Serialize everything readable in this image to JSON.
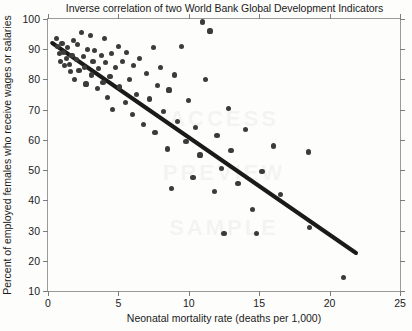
{
  "chart_data": {
    "type": "scatter",
    "title": "Inverse correlation of two World Bank Global Development Indicators",
    "xlabel": "Neonatal mortality rate (deaths per 1,000)",
    "ylabel": "Percent of employed females who receive wages or salaries",
    "xlim": [
      0,
      25
    ],
    "ylim": [
      10,
      100
    ],
    "xticks": [
      0,
      5,
      10,
      15,
      20,
      25
    ],
    "xtick_labels": [
      "0",
      "5",
      "10",
      "15",
      "20",
      "25"
    ],
    "yticks": [
      10,
      20,
      30,
      40,
      50,
      60,
      70,
      80,
      90,
      100
    ],
    "ytick_labels": [
      "10",
      "20",
      "30",
      "40",
      "50",
      "60",
      "70",
      "80",
      "90",
      "100"
    ],
    "grid": false,
    "legend": null,
    "marker_color": "#3b3b3b",
    "trendline_color": "#1a1a1a",
    "frame_color": "#9a9a9a",
    "background": "#fdfdfb",
    "trendline": {
      "label": "linear fit",
      "x0": 0.3,
      "y0": 92.0,
      "x1": 22.0,
      "y1": 22.0
    },
    "points": [
      {
        "x": 0.6,
        "y": 93.5
      },
      {
        "x": 0.7,
        "y": 91.0
      },
      {
        "x": 0.8,
        "y": 88.5
      },
      {
        "x": 0.9,
        "y": 86.0
      },
      {
        "x": 1.0,
        "y": 92.0
      },
      {
        "x": 1.1,
        "y": 89.0
      },
      {
        "x": 1.2,
        "y": 84.5
      },
      {
        "x": 1.3,
        "y": 87.0
      },
      {
        "x": 1.4,
        "y": 90.5
      },
      {
        "x": 1.5,
        "y": 85.0
      },
      {
        "x": 1.6,
        "y": 82.5
      },
      {
        "x": 1.7,
        "y": 88.0
      },
      {
        "x": 1.8,
        "y": 93.0
      },
      {
        "x": 1.9,
        "y": 80.0
      },
      {
        "x": 2.0,
        "y": 86.5
      },
      {
        "x": 2.1,
        "y": 91.5
      },
      {
        "x": 2.2,
        "y": 83.0
      },
      {
        "x": 2.4,
        "y": 95.5
      },
      {
        "x": 2.5,
        "y": 87.5
      },
      {
        "x": 2.6,
        "y": 84.0
      },
      {
        "x": 2.7,
        "y": 78.5
      },
      {
        "x": 2.8,
        "y": 90.0
      },
      {
        "x": 3.0,
        "y": 94.5
      },
      {
        "x": 3.1,
        "y": 81.5
      },
      {
        "x": 3.2,
        "y": 86.0
      },
      {
        "x": 3.3,
        "y": 89.5
      },
      {
        "x": 3.5,
        "y": 77.0
      },
      {
        "x": 3.6,
        "y": 83.5
      },
      {
        "x": 3.8,
        "y": 88.0
      },
      {
        "x": 3.9,
        "y": 79.0
      },
      {
        "x": 4.0,
        "y": 93.5
      },
      {
        "x": 4.1,
        "y": 85.5
      },
      {
        "x": 4.2,
        "y": 74.0
      },
      {
        "x": 4.4,
        "y": 81.0
      },
      {
        "x": 4.5,
        "y": 88.5
      },
      {
        "x": 4.6,
        "y": 70.0
      },
      {
        "x": 4.8,
        "y": 84.0
      },
      {
        "x": 5.0,
        "y": 91.0
      },
      {
        "x": 5.1,
        "y": 77.5
      },
      {
        "x": 5.3,
        "y": 86.0
      },
      {
        "x": 5.5,
        "y": 72.5
      },
      {
        "x": 5.6,
        "y": 89.0
      },
      {
        "x": 5.8,
        "y": 80.0
      },
      {
        "x": 6.0,
        "y": 68.5
      },
      {
        "x": 6.1,
        "y": 84.5
      },
      {
        "x": 6.3,
        "y": 75.0
      },
      {
        "x": 6.5,
        "y": 87.0
      },
      {
        "x": 6.8,
        "y": 65.0
      },
      {
        "x": 7.0,
        "y": 82.0
      },
      {
        "x": 7.2,
        "y": 73.5
      },
      {
        "x": 7.5,
        "y": 90.5
      },
      {
        "x": 7.6,
        "y": 62.5
      },
      {
        "x": 7.8,
        "y": 78.0
      },
      {
        "x": 8.0,
        "y": 84.0
      },
      {
        "x": 8.2,
        "y": 69.5
      },
      {
        "x": 8.5,
        "y": 57.0
      },
      {
        "x": 8.6,
        "y": 76.5
      },
      {
        "x": 8.8,
        "y": 44.0
      },
      {
        "x": 9.0,
        "y": 81.5
      },
      {
        "x": 9.2,
        "y": 66.0
      },
      {
        "x": 9.5,
        "y": 91.0
      },
      {
        "x": 9.8,
        "y": 59.5
      },
      {
        "x": 10.0,
        "y": 73.0
      },
      {
        "x": 10.3,
        "y": 47.5
      },
      {
        "x": 10.5,
        "y": 64.0
      },
      {
        "x": 10.8,
        "y": 55.0
      },
      {
        "x": 11.0,
        "y": 99.0
      },
      {
        "x": 11.2,
        "y": 80.0
      },
      {
        "x": 11.5,
        "y": 96.0
      },
      {
        "x": 11.8,
        "y": 43.0
      },
      {
        "x": 12.0,
        "y": 61.5
      },
      {
        "x": 12.3,
        "y": 50.5
      },
      {
        "x": 12.5,
        "y": 29.0
      },
      {
        "x": 12.8,
        "y": 70.5
      },
      {
        "x": 13.0,
        "y": 56.5
      },
      {
        "x": 13.5,
        "y": 45.5
      },
      {
        "x": 14.0,
        "y": 63.5
      },
      {
        "x": 14.5,
        "y": 37.0
      },
      {
        "x": 14.8,
        "y": 29.0
      },
      {
        "x": 15.2,
        "y": 49.5
      },
      {
        "x": 16.0,
        "y": 58.0
      },
      {
        "x": 16.5,
        "y": 42.0
      },
      {
        "x": 18.5,
        "y": 56.0
      },
      {
        "x": 18.6,
        "y": 31.0
      },
      {
        "x": 21.0,
        "y": 14.5
      }
    ]
  },
  "watermark": {
    "line1": "ACCESS",
    "line2": "PREVIEW",
    "line3": "SAMPLE"
  }
}
